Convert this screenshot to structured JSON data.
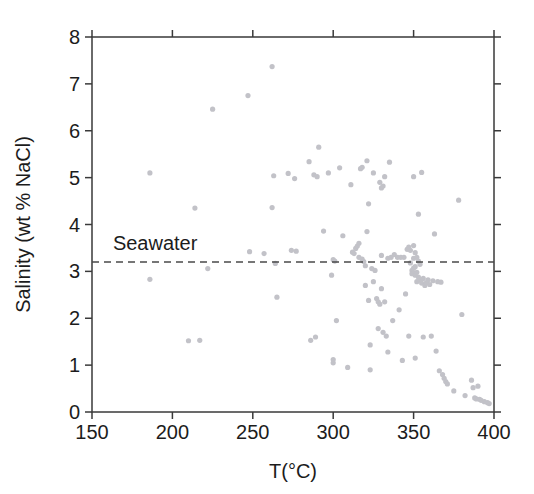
{
  "chart_data": {
    "type": "scatter",
    "title": "",
    "xlabel": "T(°C)",
    "ylabel": "Salinity (wt % NaCl)",
    "xlim": [
      150,
      400
    ],
    "ylim": [
      0,
      8
    ],
    "xticks": [
      150,
      200,
      250,
      300,
      350,
      400
    ],
    "yticks": [
      0,
      1,
      2,
      3,
      4,
      5,
      6,
      7,
      8
    ],
    "xtick_labels": [
      "150",
      "200",
      "250",
      "300",
      "350",
      "400"
    ],
    "ytick_labels": [
      "0",
      "1",
      "2",
      "3",
      "4",
      "5",
      "6",
      "7",
      "8"
    ],
    "grid": false,
    "legend": "none",
    "marker_color": "#c2c2c8",
    "marker_size": 2.6,
    "annotations": [
      {
        "type": "hline",
        "label": "Seawater",
        "y": 3.2,
        "style": "dashed",
        "color": "#4a4a4a",
        "label_x": 163,
        "label_y": 3.45
      }
    ],
    "series": [
      {
        "name": "Vent fluids",
        "points": [
          [
            186,
            5.1
          ],
          [
            186,
            2.83
          ],
          [
            210,
            1.52
          ],
          [
            214,
            4.35
          ],
          [
            217,
            1.53
          ],
          [
            222,
            3.06
          ],
          [
            225,
            6.46
          ],
          [
            247,
            6.75
          ],
          [
            248,
            3.42
          ],
          [
            257,
            3.38
          ],
          [
            262,
            7.37
          ],
          [
            262,
            4.36
          ],
          [
            263,
            5.04
          ],
          [
            264,
            3.17
          ],
          [
            265,
            2.45
          ],
          [
            272,
            5.09
          ],
          [
            274,
            3.45
          ],
          [
            276,
            4.98
          ],
          [
            277,
            3.43
          ],
          [
            285,
            5.34
          ],
          [
            286,
            1.53
          ],
          [
            288,
            5.06
          ],
          [
            289,
            1.6
          ],
          [
            290,
            5.02
          ],
          [
            291,
            5.65
          ],
          [
            294,
            3.86
          ],
          [
            297,
            5.1
          ],
          [
            299,
            2.92
          ],
          [
            300,
            1.05
          ],
          [
            300,
            1.12
          ],
          [
            300,
            3.25
          ],
          [
            301,
            3.22
          ],
          [
            302,
            1.95
          ],
          [
            304,
            5.21
          ],
          [
            306,
            3.76
          ],
          [
            309,
            0.95
          ],
          [
            311,
            4.85
          ],
          [
            312,
            3.41
          ],
          [
            313,
            3.38
          ],
          [
            314,
            3.49
          ],
          [
            315,
            3.54
          ],
          [
            316,
            3.6
          ],
          [
            316,
            3.3
          ],
          [
            317,
            5.19
          ],
          [
            318,
            5.22
          ],
          [
            318,
            3.26
          ],
          [
            319,
            3.21
          ],
          [
            320,
            3.12
          ],
          [
            320,
            2.7
          ],
          [
            321,
            5.36
          ],
          [
            321,
            3.85
          ],
          [
            322,
            4.44
          ],
          [
            322,
            2.38
          ],
          [
            323,
            1.43
          ],
          [
            323,
            0.9
          ],
          [
            324,
            3.06
          ],
          [
            325,
            5.1
          ],
          [
            325,
            2.78
          ],
          [
            326,
            3.02
          ],
          [
            327,
            2.42
          ],
          [
            328,
            2.35
          ],
          [
            328,
            1.78
          ],
          [
            329,
            4.9
          ],
          [
            329,
            2.3
          ],
          [
            330,
            4.78
          ],
          [
            330,
            3.34
          ],
          [
            330,
            2.63
          ],
          [
            331,
            4.82
          ],
          [
            331,
            1.7
          ],
          [
            332,
            5.02
          ],
          [
            332,
            2.35
          ],
          [
            333,
            1.62
          ],
          [
            334,
            3.28
          ],
          [
            334,
            1.28
          ],
          [
            335,
            5.33
          ],
          [
            336,
            3.3
          ],
          [
            337,
            1.95
          ],
          [
            338,
            3.36
          ],
          [
            340,
            3.3
          ],
          [
            341,
            2.18
          ],
          [
            342,
            3.3
          ],
          [
            343,
            1.1
          ],
          [
            344,
            3.3
          ],
          [
            345,
            2.52
          ],
          [
            346,
            3.47
          ],
          [
            347,
            3.52
          ],
          [
            347,
            1.62
          ],
          [
            348,
            3.45
          ],
          [
            348,
            3.18
          ],
          [
            349,
            3.02
          ],
          [
            349,
            2.95
          ],
          [
            350,
            5.02
          ],
          [
            350,
            3.55
          ],
          [
            350,
            3.28
          ],
          [
            350,
            3.07
          ],
          [
            350,
            2.97
          ],
          [
            351,
            3.4
          ],
          [
            351,
            3.1
          ],
          [
            351,
            2.92
          ],
          [
            351,
            1.15
          ],
          [
            352,
            3.3
          ],
          [
            352,
            2.98
          ],
          [
            352,
            2.78
          ],
          [
            353,
            4.22
          ],
          [
            353,
            3.22
          ],
          [
            353,
            2.88
          ],
          [
            354,
            3.15
          ],
          [
            354,
            2.82
          ],
          [
            355,
            5.11
          ],
          [
            355,
            2.75
          ],
          [
            356,
            2.85
          ],
          [
            356,
            1.6
          ],
          [
            357,
            2.7
          ],
          [
            358,
            2.76
          ],
          [
            359,
            2.82
          ],
          [
            360,
            2.72
          ],
          [
            361,
            1.62
          ],
          [
            362,
            2.8
          ],
          [
            363,
            3.8
          ],
          [
            364,
            1.3
          ],
          [
            365,
            2.78
          ],
          [
            366,
            0.88
          ],
          [
            367,
            2.77
          ],
          [
            368,
            0.8
          ],
          [
            369,
            0.72
          ],
          [
            370,
            0.65
          ],
          [
            371,
            0.6
          ],
          [
            375,
            0.45
          ],
          [
            378,
            4.52
          ],
          [
            380,
            2.08
          ],
          [
            382,
            0.35
          ],
          [
            386,
            0.68
          ],
          [
            387,
            0.52
          ],
          [
            388,
            0.3
          ],
          [
            389,
            0.28
          ],
          [
            390,
            0.55
          ],
          [
            391,
            0.27
          ],
          [
            392,
            0.25
          ],
          [
            394,
            0.22
          ],
          [
            396,
            0.2
          ],
          [
            397,
            0.18
          ]
        ]
      }
    ]
  },
  "geometry": {
    "plot_left": 92,
    "plot_right": 494,
    "plot_top": 37,
    "plot_bottom": 412,
    "tick_length": 7
  }
}
